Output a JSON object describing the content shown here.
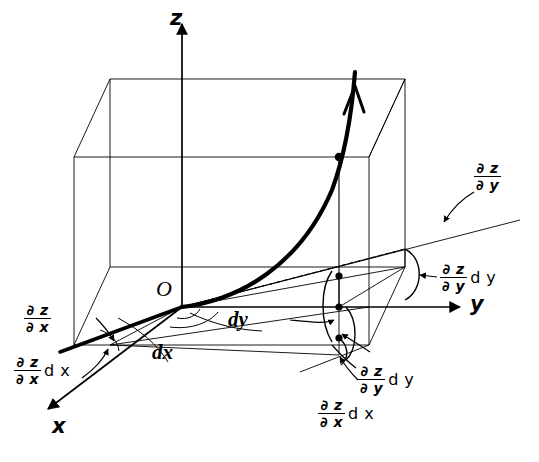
{
  "figure": {
    "kind": "3d-partial-derivative-diagram",
    "background_color": "#ffffff",
    "ink_color": "#000000",
    "origin_label": "O",
    "axes": [
      {
        "name": "z-axis",
        "label": "z",
        "direction": "up"
      },
      {
        "name": "y-axis",
        "label": "y",
        "direction": "right"
      },
      {
        "name": "x-axis",
        "label": "x",
        "direction": "down-left"
      }
    ],
    "differentials": {
      "dx": "dx",
      "dy": "dy"
    },
    "partial_z_x": {
      "numerator": "∂ z",
      "denominator": "∂ x"
    },
    "partial_z_y": {
      "numerator": "∂ z",
      "denominator": "∂ y"
    },
    "suffix_dx": "d x",
    "suffix_dy": "d y",
    "annotations": [
      {
        "name": "slope-x-plain",
        "text": "∂z/∂x"
      },
      {
        "name": "slope-x-times-dx",
        "text": "(∂z/∂x) d x"
      },
      {
        "name": "slope-y-plain",
        "text": "∂z/∂y"
      },
      {
        "name": "slope-y-times-dy-right",
        "text": "(∂z/∂y) d y"
      },
      {
        "name": "slope-y-times-dy-bottom",
        "text": "(∂z/∂y) d y"
      },
      {
        "name": "slope-x-times-dx-bottom",
        "text": "(∂z/∂x) d x"
      }
    ]
  }
}
